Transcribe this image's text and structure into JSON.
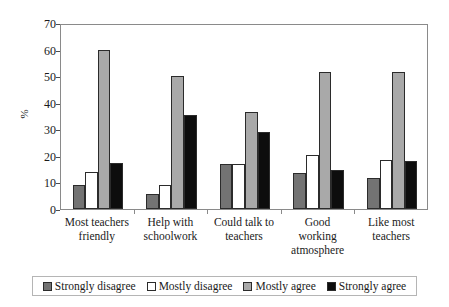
{
  "chart_data": {
    "type": "bar",
    "title": "",
    "subtitle": "",
    "xlabel": "",
    "ylabel": "%",
    "ylim": [
      0,
      70
    ],
    "y_ticks": [
      0,
      10,
      20,
      30,
      40,
      50,
      60,
      70
    ],
    "grid": false,
    "legend_position": "bottom",
    "orientation": "vertical",
    "grouping": "clustered",
    "categories": [
      "Most teachers friendly",
      "Help with schoolwork",
      "Could talk to teachers",
      "Good working atmosphere",
      "Like most teachers"
    ],
    "category_lines": [
      [
        "Most teachers",
        "friendly"
      ],
      [
        "Help with",
        "schoolwork"
      ],
      [
        "Could talk to",
        "teachers"
      ],
      [
        "Good",
        "working",
        "atmosphere"
      ],
      [
        "Like most",
        "teachers"
      ]
    ],
    "series": [
      {
        "name": "Strongly disagree",
        "color": "#737373",
        "values": [
          9,
          5.5,
          17,
          13.5,
          11.5
        ]
      },
      {
        "name": "Mostly disagree",
        "color": "#ffffff",
        "values": [
          14,
          9,
          17,
          20.5,
          18.5
        ]
      },
      {
        "name": "Mostly agree",
        "color": "#a9a9a9",
        "values": [
          60,
          50,
          36.5,
          51.5,
          51.5
        ]
      },
      {
        "name": "Strongly agree",
        "color": "#0d0d0d",
        "values": [
          17.5,
          35.5,
          29,
          14.5,
          18
        ]
      }
    ]
  },
  "axis": {
    "y_title": "%",
    "y_tick_labels": [
      "70",
      "60",
      "50",
      "40",
      "30",
      "20",
      "10",
      "0"
    ]
  },
  "legend": {
    "items": [
      {
        "label": "Strongly disagree",
        "color": "#737373"
      },
      {
        "label": "Mostly disagree",
        "color": "#ffffff"
      },
      {
        "label": "Mostly agree",
        "color": "#a9a9a9"
      },
      {
        "label": "Strongly agree",
        "color": "#0d0d0d"
      }
    ]
  }
}
